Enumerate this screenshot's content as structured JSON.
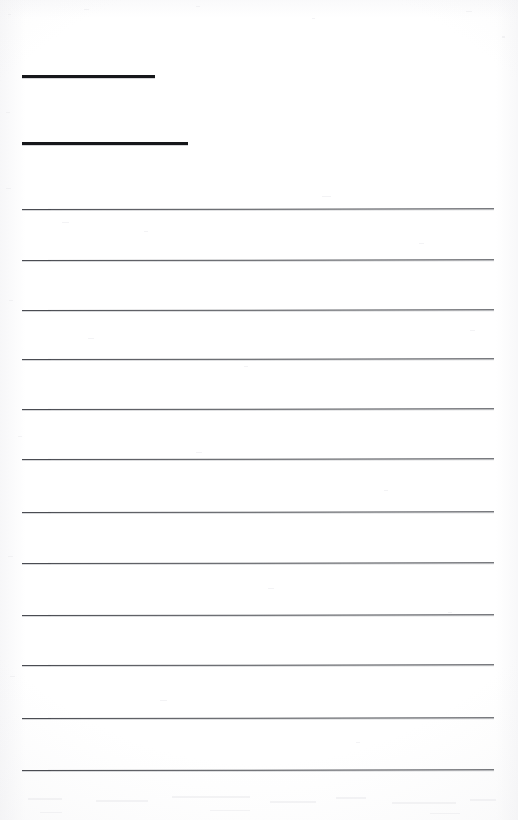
{
  "document": {
    "kind": "scanned-blank-ruled-form",
    "page_width": 518,
    "page_height": 820,
    "background_color": "#ffffff",
    "ink_color": "#16171a",
    "rule_color": "#4a4c52",
    "title": "",
    "body_text": "",
    "visible_text": []
  },
  "header_rules": {
    "count": 2,
    "description": "Two short heavy black fill-in rules near the top of the page",
    "items": [
      {
        "id": "header-rule-1",
        "label": "",
        "x": 22,
        "y": 75,
        "width": 133,
        "thickness": 3,
        "color": "#16171a"
      },
      {
        "id": "header-rule-2",
        "label": "",
        "x": 22,
        "y": 142,
        "width": 166,
        "thickness": 3,
        "color": "#16171a"
      }
    ]
  },
  "ruled_lines": {
    "count": 12,
    "left": 22,
    "right": 494,
    "width": 472,
    "thickness": 1,
    "color": "#4a4c52",
    "spacing_avg": 51,
    "slope_deg": -0.08,
    "items": [
      {
        "id": "ruled-line-1",
        "index": 1,
        "y": 209,
        "text": ""
      },
      {
        "id": "ruled-line-2",
        "index": 2,
        "y": 260,
        "text": ""
      },
      {
        "id": "ruled-line-3",
        "index": 3,
        "y": 310,
        "text": ""
      },
      {
        "id": "ruled-line-4",
        "index": 4,
        "y": 359,
        "text": ""
      },
      {
        "id": "ruled-line-5",
        "index": 5,
        "y": 409,
        "text": ""
      },
      {
        "id": "ruled-line-6",
        "index": 6,
        "y": 459,
        "text": ""
      },
      {
        "id": "ruled-line-7",
        "index": 7,
        "y": 512,
        "text": ""
      },
      {
        "id": "ruled-line-8",
        "index": 8,
        "y": 563,
        "text": ""
      },
      {
        "id": "ruled-line-9",
        "index": 9,
        "y": 615,
        "text": ""
      },
      {
        "id": "ruled-line-10",
        "index": 10,
        "y": 665,
        "text": ""
      },
      {
        "id": "ruled-line-11",
        "index": 11,
        "y": 718,
        "text": ""
      },
      {
        "id": "ruled-line-12",
        "index": 12,
        "y": 770,
        "text": ""
      }
    ]
  },
  "margins": {
    "top_blank_height": 75,
    "bottom_blank_height": 50,
    "left": 22,
    "right": 24
  }
}
